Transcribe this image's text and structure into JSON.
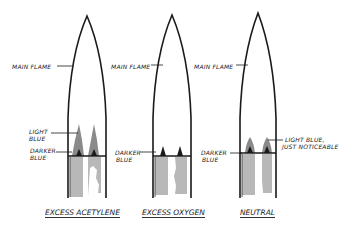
{
  "diagram": {
    "colors": {
      "line": "#1a1a1a",
      "inner_cone_fill": "#8a8a8a",
      "dark_core": "#1a1a1a",
      "shading": "#b8b8b8"
    },
    "flames": [
      {
        "id": "excess-acetylene",
        "caption": "EXCESS ACETYLENE",
        "labels": {
          "main_flame": "MAIN FLAME",
          "light_blue": [
            "LIGHT",
            "BLUE"
          ],
          "darker_blue": [
            "DARKER",
            "BLUE"
          ]
        }
      },
      {
        "id": "excess-oxygen",
        "caption": "EXCESS OXYGEN",
        "labels": {
          "main_flame": "MAIN FLAME",
          "darker_blue": [
            "DARKER",
            "BLUE"
          ]
        }
      },
      {
        "id": "neutral",
        "caption": "NEUTRAL",
        "labels": {
          "main_flame": "MAIN FLAME",
          "darker_blue": [
            "DARKER",
            "BLUE"
          ],
          "light_blue_note": [
            "LIGHT BLUE,",
            "JUST NOTICEABLE"
          ]
        }
      }
    ]
  }
}
